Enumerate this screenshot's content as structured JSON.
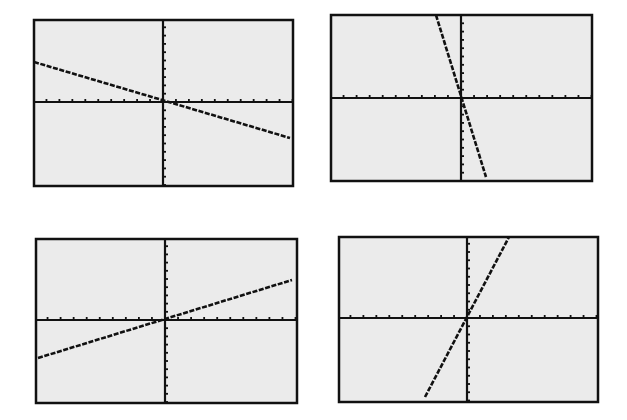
{
  "colors": {
    "background": "#ffffff",
    "screen": "#ebebeb",
    "ink": "#111111"
  },
  "chart_data": [
    {
      "type": "line",
      "title": "",
      "position": "top-left",
      "xlabel": "",
      "ylabel": "",
      "xlim": [
        -10,
        10
      ],
      "ylim": [
        -10,
        10
      ],
      "xtick_step": 1,
      "ytick_step": 1,
      "grid": false,
      "series": [
        {
          "name": "line",
          "slope": -0.5,
          "intercept": 0,
          "x": [
            -10,
            10
          ],
          "y": [
            5,
            -5
          ]
        }
      ]
    },
    {
      "type": "line",
      "title": "",
      "position": "top-right",
      "xlabel": "",
      "ylabel": "",
      "xlim": [
        -10,
        10
      ],
      "ylim": [
        -10,
        10
      ],
      "xtick_step": 1,
      "ytick_step": 1,
      "grid": false,
      "series": [
        {
          "name": "line",
          "slope": -5,
          "intercept": 0,
          "x": [
            -2,
            2
          ],
          "y": [
            10,
            -10
          ]
        }
      ]
    },
    {
      "type": "line",
      "title": "",
      "position": "bottom-left",
      "xlabel": "",
      "ylabel": "",
      "xlim": [
        -10,
        10
      ],
      "ylim": [
        -10,
        10
      ],
      "xtick_step": 1,
      "ytick_step": 1,
      "grid": false,
      "series": [
        {
          "name": "line",
          "slope": 0.5,
          "intercept": 0,
          "x": [
            -10,
            10
          ],
          "y": [
            -5,
            5
          ]
        }
      ]
    },
    {
      "type": "line",
      "title": "",
      "position": "bottom-right",
      "xlabel": "",
      "ylabel": "",
      "xlim": [
        -10,
        10
      ],
      "ylim": [
        -10,
        10
      ],
      "xtick_step": 1,
      "ytick_step": 1,
      "grid": false,
      "series": [
        {
          "name": "line",
          "slope": 3,
          "intercept": 0,
          "x": [
            -3.3,
            3.3
          ],
          "y": [
            -10,
            10
          ]
        }
      ]
    }
  ],
  "layout": {
    "panels": [
      {
        "x": 34,
        "y": 20,
        "w": 259,
        "h": 166,
        "origin_x": 163,
        "origin_y": 102,
        "line": [
          [
            34,
            62
          ],
          [
            290,
            138
          ]
        ]
      },
      {
        "x": 331,
        "y": 15,
        "w": 261,
        "h": 166,
        "origin_x": 461,
        "origin_y": 98,
        "line": [
          [
            436,
            15
          ],
          [
            486,
            177
          ]
        ]
      },
      {
        "x": 36,
        "y": 239,
        "w": 261,
        "h": 164,
        "origin_x": 165,
        "origin_y": 320,
        "line": [
          [
            38,
            358
          ],
          [
            292,
            280
          ]
        ]
      },
      {
        "x": 339,
        "y": 237,
        "w": 259,
        "h": 165,
        "origin_x": 467,
        "origin_y": 318,
        "line": [
          [
            425,
            397
          ],
          [
            509,
            237
          ]
        ]
      }
    ]
  }
}
